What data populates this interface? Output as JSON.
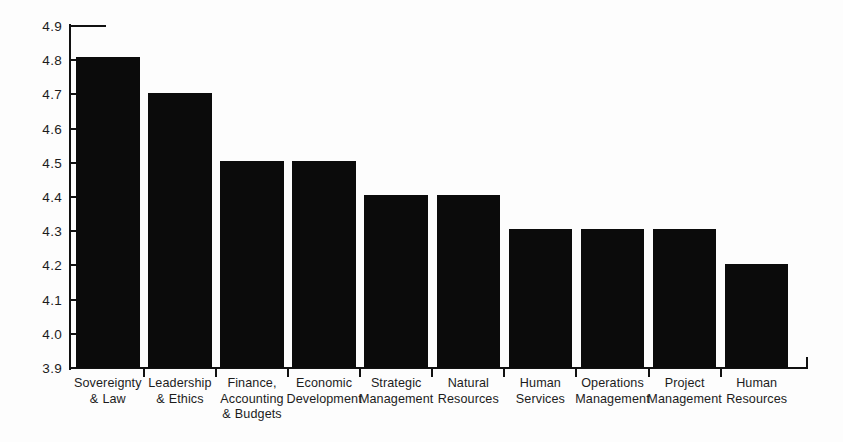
{
  "chart_data": {
    "type": "bar",
    "title": "",
    "subtitle": "",
    "xlabel": "",
    "ylabel": "",
    "ylim": [
      3.9,
      4.9
    ],
    "ytick_labels": [
      "4.9",
      "4.8",
      "4.7",
      "4.6",
      "4.5",
      "4.4",
      "4.3",
      "4.2",
      "4.1",
      "4.0",
      "3.9"
    ],
    "ytick_values": [
      4.9,
      4.8,
      4.7,
      4.6,
      4.5,
      4.4,
      4.3,
      4.2,
      4.1,
      4.0,
      3.9
    ],
    "grid": false,
    "legend": false,
    "bar_color": "#0b0b0b",
    "background_color": "#fdfdfd",
    "axis_color": "#111111",
    "categories": [
      "Sovereignty\n& Law",
      "Leadership\n& Ethics",
      "Finance,\nAccounting\n& Budgets",
      "Economic\nDevelopment",
      "Strategic\nManagement",
      "Natural\nResources",
      "Human\nServices",
      "Operations\nManagement",
      "Project\nManagement",
      "Human\nResources"
    ],
    "category_lines": [
      [
        "Sovereignty",
        "& Law"
      ],
      [
        "Leadership",
        "& Ethics"
      ],
      [
        "Finance,",
        "Accounting",
        "& Budgets"
      ],
      [
        "Economic",
        "Development"
      ],
      [
        "Strategic",
        "Management"
      ],
      [
        "Natural",
        "Resources"
      ],
      [
        "Human",
        "Services"
      ],
      [
        "Operations",
        "Management"
      ],
      [
        "Project",
        "Management"
      ],
      [
        "Human",
        "Resources"
      ]
    ],
    "values": [
      4.81,
      4.705,
      4.505,
      4.505,
      4.405,
      4.405,
      4.305,
      4.305,
      4.305,
      4.205
    ]
  }
}
